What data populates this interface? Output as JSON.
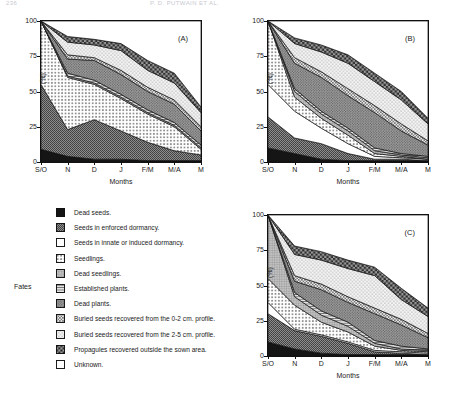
{
  "runhead": {
    "left": "236",
    "right": "P. D. PUTWAIN ET AL."
  },
  "figure": {
    "axis": {
      "ylabel": "(%)",
      "xlabel": "Months",
      "yticks": [
        "100",
        "75",
        "50",
        "25",
        "0"
      ],
      "ytick_values": [
        100,
        75,
        50,
        25,
        0
      ],
      "xticks": [
        "S/O",
        "N",
        "D",
        "J",
        "F/M",
        "M/A",
        "M"
      ],
      "ylim": [
        0,
        100
      ]
    },
    "panels": [
      {
        "tag": "(A)",
        "name": "panel-a"
      },
      {
        "tag": "(B)",
        "name": "panel-b"
      },
      {
        "tag": "(C)",
        "name": "panel-c"
      }
    ]
  },
  "legend": {
    "group_label": "Fates",
    "items": [
      {
        "label": "Dead seeds.",
        "fill": "#151515",
        "pattern": "solid-black"
      },
      {
        "label": "Seeds in enforced dormancy.",
        "fill": "#8f8f8f",
        "pattern": "dense-stipple"
      },
      {
        "label": "Seeds in innate or induced dormancy.",
        "fill": "#ffffff",
        "pattern": "blank"
      },
      {
        "label": "Seedlings.",
        "fill": "#ffffff",
        "pattern": "cross-dots"
      },
      {
        "label": "Dead seedlings.",
        "fill": "#b9b9b9",
        "pattern": "fine-grid"
      },
      {
        "label": "Established plants.",
        "fill": "#dcdcdc",
        "pattern": "horizontal-lines"
      },
      {
        "label": "Dead plants.",
        "fill": "#a8a8a8",
        "pattern": "medium-stipple"
      },
      {
        "label": "Buried seeds recovered from the 0-2 cm. profile.",
        "fill": "#e8e8e8",
        "pattern": "open-dots"
      },
      {
        "label": "Buried seeds recovered from the 2-5 cm. profile.",
        "fill": "#f2f2f2",
        "pattern": "sparse-dots"
      },
      {
        "label": "Propagules recovered outside the sown area.",
        "fill": "#777777",
        "pattern": "checker"
      },
      {
        "label": "Unknown.",
        "fill": "#ffffff",
        "pattern": "blank"
      }
    ]
  },
  "chart_data": {
    "type": "area",
    "xlabel": "Months",
    "ylabel": "(%)",
    "ylim": [
      0,
      100
    ],
    "grid": false,
    "legend_position": "left-below",
    "x": [
      "S/O",
      "N",
      "D",
      "J",
      "F/M",
      "M/A",
      "M"
    ],
    "series_order": [
      "Dead seeds.",
      "Seeds in enforced dormancy.",
      "Seeds in innate or induced dormancy.",
      "Seedlings.",
      "Dead seedlings.",
      "Established plants.",
      "Dead plants.",
      "Buried seeds recovered from the 0-2 cm. profile.",
      "Buried seeds recovered from the 2-5 cm. profile.",
      "Propagules recovered outside the sown area.",
      "Unknown."
    ],
    "panels": [
      {
        "tag": "(A)",
        "cumulative_boundaries": [
          {
            "name": "Dead seeds.",
            "values": [
              9,
              4,
              2,
              2,
              1,
              1,
              1
            ]
          },
          {
            "name": "Seeds in enforced dormancy.",
            "values": [
              55,
              23,
              30,
              22,
              14,
              8,
              5
            ]
          },
          {
            "name": "Seeds in innate or induced dormancy.",
            "values": [
              55,
              23,
              30,
              22,
              14,
              8,
              5
            ]
          },
          {
            "name": "Seedlings.",
            "values": [
              100,
              60,
              55,
              45,
              34,
              25,
              9
            ]
          },
          {
            "name": "Dead seedlings.",
            "values": [
              100,
              61,
              56,
              46,
              35,
              26,
              10
            ]
          },
          {
            "name": "Established plants.",
            "values": [
              100,
              63,
              58,
              48,
              37,
              28,
              12
            ]
          },
          {
            "name": "Dead plants.",
            "values": [
              100,
              73,
              72,
              62,
              50,
              41,
              22
            ]
          },
          {
            "name": "Buried seeds recovered from the 0-2 cm. profile.",
            "values": [
              100,
              76,
              74,
              65,
              53,
              44,
              25
            ]
          },
          {
            "name": "Buried seeds recovered from the 2-5 cm. profile.",
            "values": [
              100,
              85,
              83,
              79,
              65,
              56,
              35
            ]
          },
          {
            "name": "Propagules recovered outside the sown area.",
            "values": [
              100,
              89,
              87,
              84,
              72,
              63,
              39
            ]
          },
          {
            "name": "Unknown.",
            "values": [
              100,
              100,
              100,
              100,
              100,
              100,
              100
            ]
          }
        ]
      },
      {
        "tag": "(B)",
        "cumulative_boundaries": [
          {
            "name": "Dead seeds.",
            "values": [
              10,
              6,
              2,
              1,
              1,
              1,
              1
            ]
          },
          {
            "name": "Seeds in enforced dormancy.",
            "values": [
              32,
              17,
              13,
              6,
              2,
              2,
              1
            ]
          },
          {
            "name": "Seeds in innate or induced dormancy.",
            "values": [
              55,
              36,
              24,
              13,
              4,
              3,
              2
            ]
          },
          {
            "name": "Seedlings.",
            "values": [
              100,
              46,
              31,
              19,
              6,
              4,
              2
            ]
          },
          {
            "name": "Dead seedlings.",
            "values": [
              100,
              50,
              34,
              22,
              8,
              5,
              3
            ]
          },
          {
            "name": "Established plants.",
            "values": [
              100,
              52,
              36,
              24,
              10,
              6,
              4
            ]
          },
          {
            "name": "Dead plants.",
            "values": [
              100,
              70,
              60,
              47,
              35,
              22,
              12
            ]
          },
          {
            "name": "Buried seeds recovered from the 0-2 cm. profile.",
            "values": [
              100,
              74,
              64,
              52,
              40,
              27,
              15
            ]
          },
          {
            "name": "Buried seeds recovered from the 2-5 cm. profile.",
            "values": [
              100,
              84,
              78,
              70,
              57,
              44,
              27
            ]
          },
          {
            "name": "Propagules recovered outside the sown area.",
            "values": [
              100,
              88,
              83,
              76,
              63,
              50,
              31
            ]
          },
          {
            "name": "Unknown.",
            "values": [
              100,
              100,
              100,
              100,
              100,
              100,
              100
            ]
          }
        ]
      },
      {
        "tag": "(C)",
        "cumulative_boundaries": [
          {
            "name": "Dead seeds.",
            "values": [
              10,
              5,
              2,
              1,
              1,
              1,
              1
            ]
          },
          {
            "name": "Seeds in enforced dormancy.",
            "values": [
              30,
              18,
              14,
              9,
              3,
              2,
              1
            ]
          },
          {
            "name": "Seeds in innate or induced dormancy.",
            "values": [
              38,
              19,
              15,
              10,
              4,
              3,
              2
            ]
          },
          {
            "name": "Seedlings.",
            "values": [
              55,
              36,
              24,
              17,
              7,
              4,
              3
            ]
          },
          {
            "name": "Dead seedlings.",
            "values": [
              100,
              42,
              29,
              21,
              9,
              5,
              4
            ]
          },
          {
            "name": "Established plants.",
            "values": [
              100,
              45,
              32,
              24,
              11,
              7,
              5
            ]
          },
          {
            "name": "Dead plants.",
            "values": [
              100,
              53,
              47,
              38,
              30,
              22,
              13
            ]
          },
          {
            "name": "Buried seeds recovered from the 0-2 cm. profile.",
            "values": [
              100,
              57,
              51,
              42,
              34,
              26,
              16
            ]
          },
          {
            "name": "Buried seeds recovered from the 2-5 cm. profile.",
            "values": [
              100,
              72,
              68,
              62,
              57,
              40,
              28
            ]
          },
          {
            "name": "Propagules recovered outside the sown area.",
            "values": [
              100,
              78,
              74,
              68,
              63,
              48,
              34
            ]
          },
          {
            "name": "Unknown.",
            "values": [
              100,
              100,
              100,
              100,
              100,
              100,
              100
            ]
          }
        ]
      }
    ]
  }
}
